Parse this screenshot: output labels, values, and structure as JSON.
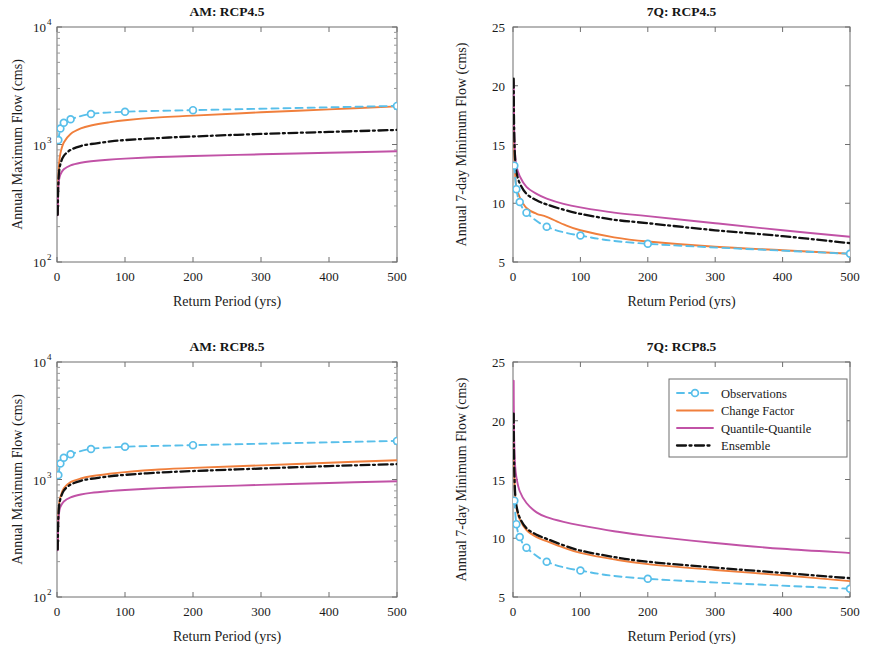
{
  "figure": {
    "panel_order": [
      "am_rcp45",
      "7q_rcp45",
      "am_rcp85",
      "7q_rcp85"
    ]
  },
  "legend": {
    "position": "top-right of 7Q: RCP8.5 panel",
    "entries": [
      {
        "label": "Observations",
        "color": "#58BFEA",
        "style": "dashed-circle-marker"
      },
      {
        "label": "Change Factor",
        "color": "#F07F3C",
        "style": "solid"
      },
      {
        "label": "Quantile-Quantile",
        "color": "#C152A6",
        "style": "solid"
      },
      {
        "label": "Ensemble",
        "color": "#111111",
        "style": "dash-dot"
      }
    ]
  },
  "colors": {
    "observations": "#58BFEA",
    "change_factor": "#F07F3C",
    "quantile_quantile": "#C152A6",
    "ensemble": "#111111",
    "axis": "#6f6f6f",
    "background": "#ffffff"
  },
  "chart_data": [
    {
      "id": "am_rcp45",
      "type": "line",
      "title": "AM: RCP4.5",
      "xlabel": "Return Period (yrs)",
      "ylabel": "Annual Maximum Flow (cms)",
      "xlim": [
        0,
        500
      ],
      "ylim": [
        100,
        10000
      ],
      "yscale": "log",
      "xscale": "linear",
      "xticks": [
        0,
        100,
        200,
        300,
        400,
        500
      ],
      "yticks": [
        100,
        1000,
        10000
      ],
      "ytick_labels": [
        "10^2",
        "10^3",
        "10^4"
      ],
      "grid": false,
      "series": [
        {
          "name": "Observations",
          "color": "#58BFEA",
          "style": "dashed",
          "markers": true,
          "x": [
            2,
            5,
            10,
            20,
            50,
            100,
            200,
            500
          ],
          "values": [
            1090,
            1370,
            1530,
            1640,
            1820,
            1900,
            1960,
            2130
          ]
        },
        {
          "name": "Change Factor",
          "color": "#F07F3C",
          "style": "solid",
          "markers": false,
          "x": [
            1.05,
            1.5,
            2,
            3,
            5,
            10,
            20,
            35,
            50,
            75,
            100,
            150,
            200,
            300,
            400,
            500
          ],
          "values": [
            255,
            400,
            520,
            680,
            840,
            1040,
            1230,
            1370,
            1450,
            1540,
            1610,
            1700,
            1760,
            1880,
            1990,
            2110
          ]
        },
        {
          "name": "Quantile-Quantile",
          "color": "#C152A6",
          "style": "solid",
          "markers": false,
          "x": [
            1.05,
            1.5,
            2,
            3,
            5,
            10,
            20,
            35,
            50,
            75,
            100,
            150,
            200,
            300,
            400,
            500
          ],
          "values": [
            250,
            360,
            430,
            500,
            555,
            615,
            665,
            700,
            720,
            742,
            758,
            782,
            798,
            825,
            850,
            875
          ]
        },
        {
          "name": "Ensemble",
          "color": "#111111",
          "style": "dashdot",
          "markers": false,
          "x": [
            1.05,
            1.5,
            2,
            3,
            5,
            10,
            20,
            35,
            50,
            75,
            100,
            150,
            200,
            300,
            400,
            500
          ],
          "values": [
            252,
            380,
            470,
            580,
            680,
            800,
            900,
            970,
            1010,
            1055,
            1090,
            1135,
            1170,
            1230,
            1280,
            1330
          ]
        }
      ]
    },
    {
      "id": "7q_rcp45",
      "type": "line",
      "title": "7Q: RCP4.5",
      "xlabel": "Return Period (yrs)",
      "ylabel": "Annual 7-day Minimum Flow (cms)",
      "xlim": [
        0,
        500
      ],
      "ylim": [
        5,
        25
      ],
      "yscale": "linear",
      "xscale": "linear",
      "xticks": [
        0,
        100,
        200,
        300,
        400,
        500
      ],
      "yticks": [
        5,
        10,
        15,
        20,
        25
      ],
      "ytick_labels": [
        "5",
        "10",
        "15",
        "20",
        "25"
      ],
      "grid": false,
      "series": [
        {
          "name": "Observations",
          "color": "#58BFEA",
          "style": "dashed",
          "markers": true,
          "x": [
            2,
            5,
            10,
            20,
            50,
            100,
            200,
            500
          ],
          "values": [
            13.2,
            11.2,
            10.1,
            9.2,
            8.0,
            7.25,
            6.55,
            5.7
          ]
        },
        {
          "name": "Change Factor",
          "color": "#F07F3C",
          "style": "solid",
          "markers": false,
          "x": [
            1.02,
            1.2,
            1.5,
            2,
            3,
            5,
            10,
            20,
            35,
            50,
            75,
            100,
            150,
            200,
            300,
            400,
            500
          ],
          "values": [
            19.0,
            17.2,
            15.6,
            14.2,
            12.6,
            11.4,
            10.5,
            9.6,
            9.1,
            8.85,
            8.2,
            7.7,
            7.1,
            6.75,
            6.3,
            6.0,
            5.7
          ]
        },
        {
          "name": "Quantile-Quantile",
          "color": "#C152A6",
          "style": "solid",
          "markers": false,
          "x": [
            1.02,
            1.2,
            1.5,
            2,
            3,
            5,
            10,
            20,
            35,
            50,
            75,
            100,
            150,
            200,
            300,
            400,
            500
          ],
          "values": [
            20.3,
            18.6,
            17.1,
            15.8,
            14.3,
            13.2,
            12.3,
            11.4,
            10.8,
            10.4,
            9.95,
            9.65,
            9.2,
            8.9,
            8.3,
            7.7,
            7.15
          ]
        },
        {
          "name": "Ensemble",
          "color": "#111111",
          "style": "dashdot",
          "markers": false,
          "x": [
            1.02,
            1.2,
            1.5,
            2,
            3,
            5,
            10,
            20,
            35,
            50,
            75,
            100,
            150,
            200,
            300,
            400,
            500
          ],
          "values": [
            20.6,
            18.8,
            17.0,
            15.5,
            13.9,
            12.7,
            11.7,
            10.8,
            10.25,
            9.9,
            9.45,
            9.1,
            8.6,
            8.3,
            7.7,
            7.2,
            6.6
          ]
        }
      ]
    },
    {
      "id": "am_rcp85",
      "type": "line",
      "title": "AM: RCP8.5",
      "xlabel": "Return Period (yrs)",
      "ylabel": "Annual Maximum Flow (cms)",
      "xlim": [
        0,
        500
      ],
      "ylim": [
        100,
        10000
      ],
      "yscale": "log",
      "xscale": "linear",
      "xticks": [
        0,
        100,
        200,
        300,
        400,
        500
      ],
      "yticks": [
        100,
        1000,
        10000
      ],
      "ytick_labels": [
        "10^2",
        "10^3",
        "10^4"
      ],
      "grid": false,
      "series": [
        {
          "name": "Observations",
          "color": "#58BFEA",
          "style": "dashed",
          "markers": true,
          "x": [
            2,
            5,
            10,
            20,
            50,
            100,
            200,
            500
          ],
          "values": [
            1090,
            1370,
            1530,
            1640,
            1820,
            1900,
            1960,
            2130
          ]
        },
        {
          "name": "Change Factor",
          "color": "#F07F3C",
          "style": "solid",
          "markers": false,
          "x": [
            1.05,
            1.5,
            2,
            3,
            5,
            10,
            20,
            35,
            50,
            75,
            100,
            150,
            200,
            300,
            400,
            500
          ],
          "values": [
            258,
            390,
            490,
            610,
            710,
            840,
            950,
            1020,
            1065,
            1115,
            1155,
            1215,
            1255,
            1320,
            1390,
            1460
          ]
        },
        {
          "name": "Quantile-Quantile",
          "color": "#C152A6",
          "style": "solid",
          "markers": false,
          "x": [
            1.05,
            1.5,
            2,
            3,
            5,
            10,
            20,
            35,
            50,
            75,
            100,
            150,
            200,
            300,
            400,
            500
          ],
          "values": [
            250,
            365,
            440,
            520,
            585,
            650,
            705,
            745,
            770,
            795,
            815,
            845,
            865,
            900,
            935,
            965
          ]
        },
        {
          "name": "Ensemble",
          "color": "#111111",
          "style": "dashdot",
          "markers": false,
          "x": [
            1.05,
            1.5,
            2,
            3,
            5,
            10,
            20,
            35,
            50,
            75,
            100,
            150,
            200,
            300,
            400,
            500
          ],
          "values": [
            254,
            382,
            475,
            588,
            685,
            805,
            905,
            975,
            1015,
            1060,
            1095,
            1145,
            1180,
            1240,
            1300,
            1350
          ]
        }
      ]
    },
    {
      "id": "7q_rcp85",
      "type": "line",
      "title": "7Q: RCP8.5",
      "xlabel": "Return Period (yrs)",
      "ylabel": "Annual 7-day Minimum Flow (cms)",
      "xlim": [
        0,
        500
      ],
      "ylim": [
        5,
        25
      ],
      "yscale": "linear",
      "xscale": "linear",
      "xticks": [
        0,
        100,
        200,
        300,
        400,
        500
      ],
      "yticks": [
        5,
        10,
        15,
        20,
        25
      ],
      "ytick_labels": [
        "5",
        "10",
        "15",
        "20",
        "25"
      ],
      "grid": false,
      "series": [
        {
          "name": "Observations",
          "color": "#58BFEA",
          "style": "dashed",
          "markers": true,
          "x": [
            2,
            5,
            10,
            20,
            50,
            100,
            200,
            500
          ],
          "values": [
            13.2,
            11.2,
            10.1,
            9.2,
            8.0,
            7.25,
            6.55,
            5.7
          ]
        },
        {
          "name": "Change Factor",
          "color": "#F07F3C",
          "style": "solid",
          "markers": false,
          "x": [
            1.02,
            1.2,
            1.5,
            2,
            3,
            5,
            10,
            20,
            35,
            50,
            75,
            100,
            150,
            200,
            300,
            400,
            500
          ],
          "values": [
            20.4,
            18.6,
            16.9,
            15.4,
            13.8,
            12.6,
            11.6,
            10.7,
            10.1,
            9.75,
            9.2,
            8.75,
            8.2,
            7.8,
            7.3,
            6.85,
            6.35
          ]
        },
        {
          "name": "Quantile-Quantile",
          "color": "#C152A6",
          "style": "solid",
          "markers": false,
          "x": [
            1.02,
            1.2,
            1.5,
            2,
            3,
            5,
            10,
            20,
            35,
            50,
            75,
            100,
            150,
            200,
            300,
            400,
            500
          ],
          "values": [
            23.4,
            21.3,
            19.4,
            17.9,
            16.3,
            15.2,
            14.0,
            13.0,
            12.2,
            11.8,
            11.4,
            11.1,
            10.6,
            10.2,
            9.6,
            9.1,
            8.75
          ]
        },
        {
          "name": "Ensemble",
          "color": "#111111",
          "style": "dashdot",
          "markers": false,
          "x": [
            1.02,
            1.2,
            1.5,
            2,
            3,
            5,
            10,
            20,
            35,
            50,
            75,
            100,
            150,
            200,
            300,
            400,
            500
          ],
          "values": [
            20.6,
            18.8,
            17.1,
            15.6,
            14.0,
            12.8,
            11.75,
            10.85,
            10.3,
            9.95,
            9.4,
            8.95,
            8.4,
            8.0,
            7.5,
            7.05,
            6.6
          ]
        }
      ]
    }
  ]
}
